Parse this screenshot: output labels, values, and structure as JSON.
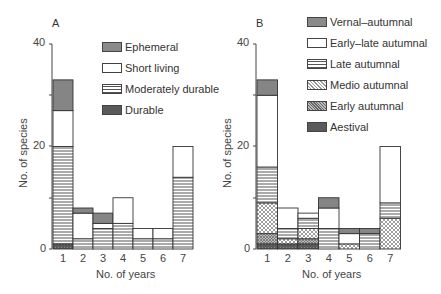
{
  "chart_data": [
    {
      "panel": "A",
      "type": "bar",
      "stacked": true,
      "title": "A",
      "xlabel": "No. of years",
      "ylabel": "No. of species",
      "ylim": [
        0,
        40
      ],
      "yticks": [
        0,
        20,
        40
      ],
      "categories": [
        "1",
        "2",
        "3",
        "4",
        "5",
        "6",
        "7"
      ],
      "series": [
        {
          "name": "Durable",
          "pattern": "dark-dotted",
          "values": [
            1,
            0,
            0,
            0,
            0,
            0,
            0
          ]
        },
        {
          "name": "Moderately durable",
          "pattern": "horizontal-lines",
          "values": [
            19,
            2,
            4,
            5,
            2,
            2,
            14
          ]
        },
        {
          "name": "Short living",
          "pattern": "white",
          "values": [
            7,
            5,
            1,
            5,
            2,
            2,
            6
          ]
        },
        {
          "name": "Ephemeral",
          "pattern": "grey-shaded",
          "values": [
            6,
            1,
            2,
            0,
            0,
            0,
            0
          ]
        }
      ],
      "totals": [
        33,
        8,
        7,
        10,
        4,
        4,
        20
      ],
      "legend": [
        "Ephemeral",
        "Short living",
        "Moderately durable",
        "Durable"
      ],
      "legend_position": "upper right",
      "grid": false
    },
    {
      "panel": "B",
      "type": "bar",
      "stacked": true,
      "title": "B",
      "xlabel": "No. of years",
      "ylabel": "No. of species",
      "ylim": [
        0,
        40
      ],
      "yticks": [
        0,
        20,
        40
      ],
      "categories": [
        "1",
        "2",
        "3",
        "4",
        "5",
        "6",
        "7"
      ],
      "series": [
        {
          "name": "Aestival",
          "pattern": "dark-dotted",
          "values": [
            1,
            1,
            1,
            0,
            0,
            0,
            0
          ]
        },
        {
          "name": "Early autumnal",
          "pattern": "dense-crosshatch",
          "values": [
            2,
            0,
            1,
            0,
            0,
            0,
            0
          ]
        },
        {
          "name": "Medio autumnal",
          "pattern": "crosshatch",
          "values": [
            6,
            1,
            2,
            0,
            1,
            0,
            6
          ]
        },
        {
          "name": "Late autumnal",
          "pattern": "horizontal-lines",
          "values": [
            7,
            2,
            2,
            4,
            0,
            3,
            3
          ]
        },
        {
          "name": "Early–late autumnal",
          "pattern": "white",
          "values": [
            14,
            4,
            1,
            4,
            2,
            0,
            11
          ]
        },
        {
          "name": "Vernal–autumnal",
          "pattern": "grey-shaded",
          "values": [
            3,
            0,
            0,
            2,
            1,
            1,
            0
          ]
        }
      ],
      "totals": [
        33,
        8,
        7,
        10,
        4,
        4,
        20
      ],
      "legend": [
        "Vernal–autumnal",
        "Early–late autumnal",
        "Late autumnal",
        "Medio autumnal",
        "Early autumnal",
        "Aestival"
      ],
      "legend_position": "upper right",
      "grid": false
    }
  ],
  "panelA": {
    "letter": "A",
    "ytick_40": "40",
    "ytick_20": "20",
    "ytick_0": "0",
    "ylabel": "No. of species",
    "xlabel": "No. of years",
    "xticks": [
      "1",
      "2",
      "3",
      "4",
      "5",
      "6",
      "7"
    ],
    "legend": [
      "Ephemeral",
      "Short living",
      "Moderately durable",
      "Durable"
    ]
  },
  "panelB": {
    "letter": "B",
    "ytick_40": "40",
    "ytick_20": "20",
    "ytick_0": "0",
    "ylabel": "No. of species",
    "xlabel": "No. of years",
    "xticks": [
      "1",
      "2",
      "3",
      "4",
      "5",
      "6",
      "7"
    ],
    "legend": [
      "Vernal–autumnal",
      "Early–late autumnal",
      "Late autumnal",
      "Medio autumnal",
      "Early autumnal",
      "Aestival"
    ]
  },
  "colors": {
    "axis": "#444444",
    "grey_fill": "#8a8a8a",
    "dark_fill": "#555555",
    "line": "#333333"
  }
}
